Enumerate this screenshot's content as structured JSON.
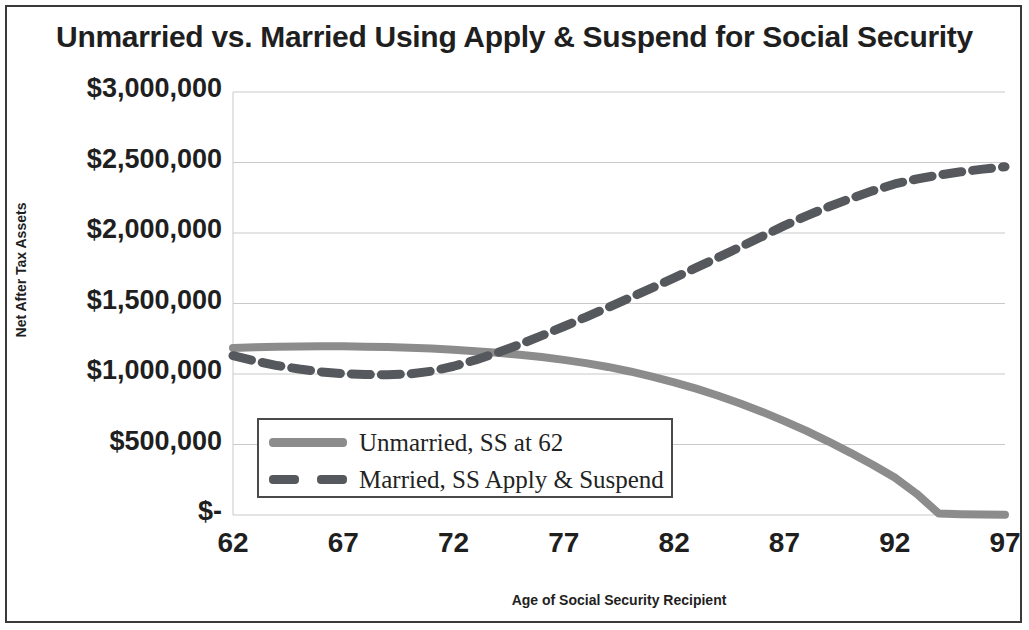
{
  "chart_data": {
    "type": "line",
    "title": "Unmarried vs. Married Using Apply & Suspend for Social Security",
    "xlabel": "Age of Social Security Recipient",
    "ylabel": "Net After Tax Assets",
    "xlim": [
      62,
      97
    ],
    "ylim": [
      0,
      3000000
    ],
    "grid": true,
    "legend_position": "center-left-inside",
    "x_tick_labels": [
      "62",
      "67",
      "72",
      "77",
      "82",
      "87",
      "92",
      "97"
    ],
    "x_ticks": [
      62,
      67,
      72,
      77,
      82,
      87,
      92,
      97
    ],
    "y_tick_labels": [
      "$3,000,000",
      "$2,500,000",
      "$2,000,000",
      "$1,500,000",
      "$1,000,000",
      "$500,000",
      "$-"
    ],
    "y_ticks": [
      3000000,
      2500000,
      2000000,
      1500000,
      1000000,
      500000,
      0
    ],
    "x": [
      62,
      63,
      64,
      65,
      66,
      67,
      68,
      69,
      70,
      71,
      72,
      73,
      74,
      75,
      76,
      77,
      78,
      79,
      80,
      81,
      82,
      83,
      84,
      85,
      86,
      87,
      88,
      89,
      90,
      91,
      92,
      93,
      94,
      95,
      96,
      97
    ],
    "series": [
      {
        "name": "Unmarried, SS at 62",
        "style": "solid",
        "color": "#8c8c8c",
        "values": [
          1185000,
          1190000,
          1193000,
          1195000,
          1196000,
          1196000,
          1194000,
          1191000,
          1186000,
          1180000,
          1172000,
          1162000,
          1150000,
          1136000,
          1120000,
          1100000,
          1077000,
          1050000,
          1018000,
          982000,
          941000,
          896000,
          846000,
          791000,
          731000,
          666000,
          596000,
          521000,
          441000,
          356000,
          266000,
          150000,
          10000,
          5000,
          3000,
          2000
        ]
      },
      {
        "name": "Married, SS Apply & Suspend",
        "style": "dashed",
        "color": "#55585c",
        "values": [
          1130000,
          1092000,
          1060000,
          1035000,
          1015000,
          1002000,
          996000,
          995000,
          1000000,
          1020000,
          1055000,
          1100000,
          1152000,
          1210000,
          1272000,
          1337000,
          1404000,
          1472000,
          1541000,
          1611000,
          1682000,
          1754000,
          1827000,
          1901000,
          1976000,
          2052000,
          2122000,
          2186000,
          2245000,
          2299000,
          2348000,
          2383000,
          2411000,
          2434000,
          2453000,
          2470000
        ]
      }
    ]
  },
  "legend": {
    "items": [
      {
        "label": "Unmarried, SS at 62",
        "style": "solid"
      },
      {
        "label": "Married, SS Apply & Suspend",
        "style": "dashed"
      }
    ]
  },
  "colors": {
    "solid_series": "#8c8c8c",
    "dashed_series": "#55585c",
    "gridline": "#c9c9c9",
    "text": "#1f1f1f",
    "frame": "#3a3a3a"
  }
}
